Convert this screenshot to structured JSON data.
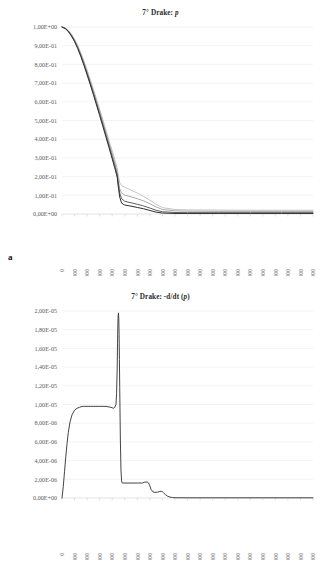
{
  "figure": {
    "panels": [
      {
        "letter": "a",
        "title_prefix": "7° Drake: ",
        "title_italic": "p"
      },
      {
        "letter": "b",
        "title_prefix": "7° Drake: -d/dt (",
        "title_italic": "p",
        "title_suffix": ")"
      }
    ]
  },
  "chart_data": [
    {
      "type": "line",
      "title": "7° Drake: p",
      "xlabel": "",
      "ylabel": "",
      "xlim": [
        0,
        400000
      ],
      "ylim": [
        0,
        1.0
      ],
      "grid": true,
      "legend": "none",
      "xticks": [
        0,
        20000,
        40000,
        60000,
        80000,
        100000,
        120000,
        140000,
        160000,
        180000,
        200000,
        220000,
        240000,
        260000,
        280000,
        300000,
        320000,
        340000,
        360000,
        380000,
        400000
      ],
      "xticklabels": [
        "0",
        "20.000",
        "40.000",
        "60.000",
        "80.000",
        "100.000",
        "120.000",
        "140.000",
        "160.000",
        "180.000",
        "200.000",
        "220.000",
        "240.000",
        "260.000",
        "280.000",
        "300.000",
        "320.000",
        "340.000",
        "360.000",
        "380.000",
        "400.000"
      ],
      "yticks": [
        0,
        0.1,
        0.2,
        0.3,
        0.4,
        0.5,
        0.6,
        0.7,
        0.8,
        0.9,
        1.0
      ],
      "yticklabels": [
        "0,00E+00",
        "1,00E-01",
        "2,00E-01",
        "3,00E-01",
        "4,00E-01",
        "5,00E-01",
        "6,00E-01",
        "7,00E-01",
        "8,00E-01",
        "9,00E-01",
        "1,00E+00"
      ],
      "series": [
        {
          "name": "curve-1",
          "color": "#b9b9b9",
          "width": 0.85,
          "x": [
            0,
            5000,
            10000,
            15000,
            20000,
            25000,
            30000,
            35000,
            40000,
            45000,
            50000,
            55000,
            60000,
            65000,
            70000,
            75000,
            80000,
            85000,
            88000,
            90000,
            92000,
            95000,
            100000,
            110000,
            120000,
            130000,
            140000,
            150000,
            160000,
            180000,
            200000,
            250000,
            300000,
            350000,
            400000
          ],
          "y": [
            1.0,
            0.995,
            0.982,
            0.962,
            0.936,
            0.902,
            0.862,
            0.818,
            0.77,
            0.72,
            0.668,
            0.615,
            0.561,
            0.506,
            0.45,
            0.394,
            0.338,
            0.281,
            0.246,
            0.2,
            0.168,
            0.152,
            0.143,
            0.128,
            0.112,
            0.094,
            0.074,
            0.052,
            0.034,
            0.024,
            0.022,
            0.021,
            0.02,
            0.02,
            0.02
          ]
        },
        {
          "name": "curve-2",
          "color": "#9a9a9a",
          "width": 0.85,
          "x": [
            0,
            5000,
            10000,
            15000,
            20000,
            25000,
            30000,
            35000,
            40000,
            45000,
            50000,
            55000,
            60000,
            65000,
            70000,
            75000,
            80000,
            85000,
            88000,
            90000,
            92000,
            95000,
            100000,
            110000,
            120000,
            130000,
            140000,
            150000,
            160000,
            180000,
            200000,
            250000,
            300000,
            350000,
            400000
          ],
          "y": [
            1.0,
            0.994,
            0.98,
            0.958,
            0.93,
            0.895,
            0.854,
            0.809,
            0.76,
            0.709,
            0.657,
            0.603,
            0.548,
            0.492,
            0.436,
            0.379,
            0.322,
            0.263,
            0.225,
            0.175,
            0.135,
            0.113,
            0.101,
            0.092,
            0.082,
            0.07,
            0.055,
            0.038,
            0.024,
            0.017,
            0.015,
            0.014,
            0.014,
            0.014,
            0.014
          ]
        },
        {
          "name": "curve-3",
          "color": "#555555",
          "width": 0.95,
          "x": [
            0,
            5000,
            10000,
            15000,
            20000,
            25000,
            30000,
            35000,
            40000,
            45000,
            50000,
            55000,
            60000,
            65000,
            70000,
            75000,
            80000,
            85000,
            88000,
            90000,
            92000,
            95000,
            100000,
            110000,
            120000,
            130000,
            140000,
            150000,
            160000,
            180000,
            200000,
            250000,
            300000,
            350000,
            400000
          ],
          "y": [
            1.0,
            0.993,
            0.978,
            0.955,
            0.926,
            0.89,
            0.848,
            0.802,
            0.752,
            0.7,
            0.647,
            0.592,
            0.536,
            0.48,
            0.423,
            0.365,
            0.307,
            0.248,
            0.209,
            0.155,
            0.112,
            0.082,
            0.068,
            0.06,
            0.052,
            0.043,
            0.032,
            0.02,
            0.012,
            0.008,
            0.007,
            0.007,
            0.007,
            0.007,
            0.007
          ]
        },
        {
          "name": "curve-4",
          "color": "#2e2e2e",
          "width": 1.0,
          "x": [
            0,
            5000,
            10000,
            15000,
            20000,
            25000,
            30000,
            35000,
            40000,
            45000,
            50000,
            55000,
            60000,
            65000,
            70000,
            75000,
            80000,
            85000,
            88000,
            90000,
            92000,
            95000,
            100000,
            110000,
            120000,
            130000,
            140000,
            150000,
            160000,
            180000,
            200000,
            250000,
            300000,
            350000,
            400000
          ],
          "y": [
            1.0,
            0.992,
            0.976,
            0.952,
            0.922,
            0.885,
            0.842,
            0.795,
            0.744,
            0.692,
            0.638,
            0.583,
            0.527,
            0.47,
            0.412,
            0.354,
            0.295,
            0.235,
            0.195,
            0.138,
            0.09,
            0.058,
            0.048,
            0.042,
            0.035,
            0.028,
            0.019,
            0.01,
            0.005,
            0.003,
            0.003,
            0.003,
            0.003,
            0.003,
            0.003
          ]
        }
      ]
    },
    {
      "type": "line",
      "title": "7° Drake: -d/dt (p)",
      "xlabel": "",
      "ylabel": "",
      "xlim": [
        0,
        400000
      ],
      "ylim": [
        0,
        2e-05
      ],
      "grid": true,
      "legend": "none",
      "xticks": [
        0,
        20000,
        40000,
        60000,
        80000,
        100000,
        120000,
        140000,
        160000,
        180000,
        200000,
        220000,
        240000,
        260000,
        280000,
        300000,
        320000,
        340000,
        360000,
        380000,
        400000
      ],
      "xticklabels": [
        "0",
        "20.000",
        "40.000",
        "60.000",
        "80.000",
        "100.000",
        "120.000",
        "140.000",
        "160.000",
        "180.000",
        "200.000",
        "220.000",
        "240.000",
        "260.000",
        "280.000",
        "300.000",
        "320.000",
        "340.000",
        "360.000",
        "380.000",
        "400.000"
      ],
      "yticks": [
        0,
        2e-06,
        4e-06,
        6e-06,
        8e-06,
        1e-05,
        1.2e-05,
        1.4e-05,
        1.6e-05,
        1.8e-05,
        2e-05
      ],
      "yticklabels": [
        "0,00E+00",
        "2,00E-06",
        "4,00E-06",
        "6,00E-06",
        "8,00E-06",
        "1,00E-05",
        "1,20E-05",
        "1,40E-05",
        "1,60E-05",
        "1,80E-05",
        "2,00E-05"
      ],
      "series": [
        {
          "name": "derivative-curve",
          "color": "#3a3a3a",
          "width": 0.95,
          "x": [
            0,
            2000,
            4000,
            6000,
            8000,
            10000,
            13000,
            16000,
            20000,
            24000,
            28000,
            32000,
            36000,
            40000,
            45000,
            50000,
            60000,
            70000,
            78000,
            82000,
            84000,
            86000,
            87000,
            88000,
            88500,
            89000,
            89500,
            90000,
            90500,
            91000,
            91500,
            92000,
            93000,
            94000,
            95000,
            96000,
            100000,
            110000,
            120000,
            128000,
            132000,
            136000,
            138000,
            140000,
            142000,
            145000,
            148000,
            152000,
            156000,
            158000,
            160000,
            162000,
            165000,
            168000,
            172000,
            176000,
            180000,
            200000,
            240000,
            280000,
            320000,
            360000,
            400000
          ],
          "y": [
            0.0,
            1.2e-06,
            2.8e-06,
            4.4e-06,
            5.8e-06,
            7e-06,
            8.2e-06,
            8.9e-06,
            9.4e-06,
            9.6e-06,
            9.7e-06,
            9.8e-06,
            9.8e-06,
            9.8e-06,
            9.8e-06,
            9.8e-06,
            9.8e-06,
            9.8e-06,
            9.7e-06,
            9.6e-06,
            9.7e-06,
            1e-05,
            1.12e-05,
            1.4e-05,
            1.65e-05,
            1.85e-05,
            1.95e-05,
            1.98e-05,
            1.92e-05,
            1.75e-05,
            1.48e-05,
            1.18e-05,
            6.2e-06,
            3e-06,
            1.8e-06,
            1.6e-06,
            1.6e-06,
            1.6e-06,
            1.6e-06,
            1.6e-06,
            1.7e-06,
            1.7e-06,
            1.6e-06,
            1.3e-06,
            9e-07,
            6.5e-07,
            6e-07,
            6.2e-07,
            7e-07,
            7.2e-07,
            6.8e-07,
            5.5e-07,
            3.5e-07,
            2e-07,
            1e-07,
            5e-08,
            3e-08,
            2e-08,
            2e-08,
            2e-08,
            2e-08,
            2e-08,
            2e-08
          ]
        }
      ]
    }
  ]
}
